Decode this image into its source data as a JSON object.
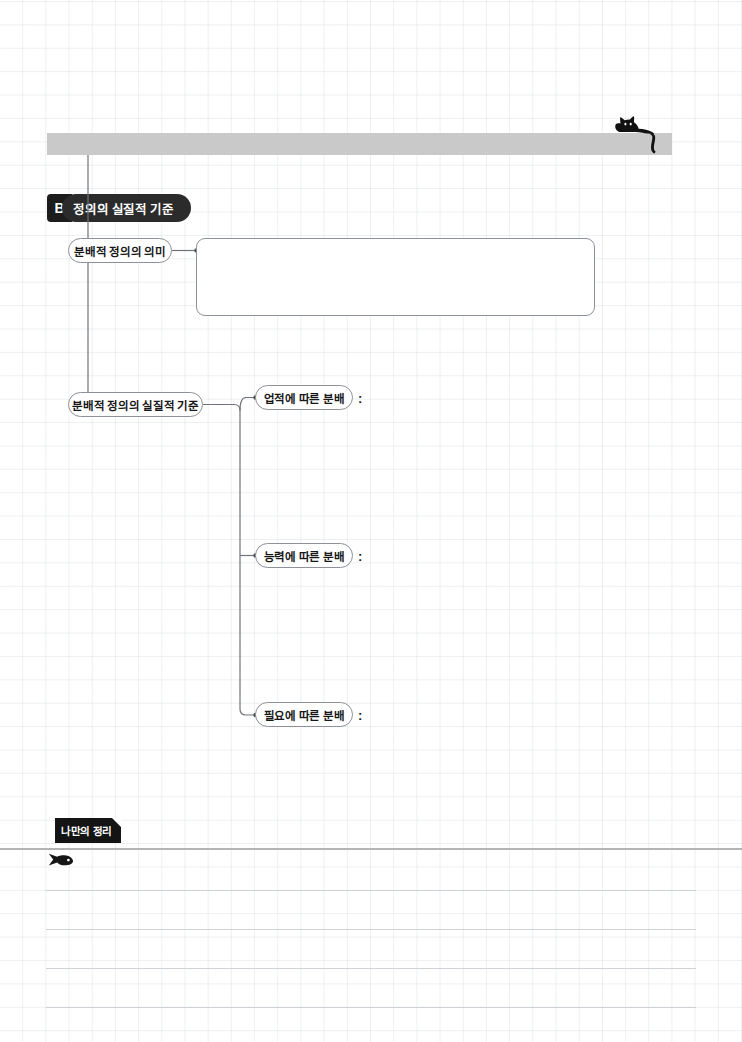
{
  "page": {
    "background": "#ffffff",
    "grid_color": "#e6e9ec",
    "ink_color": "#171717",
    "node_border_color": "#8d9199",
    "band_color": "#c9c9c9",
    "tag_color": "#141414"
  },
  "header": {
    "band_label": "",
    "cat_icon": "black-cat-icon"
  },
  "section": {
    "letter": "B",
    "title": "정의의 실질적 기준"
  },
  "nodes": {
    "meaning": "분배적 정의의 의미",
    "criteria": "분배적 정의의 실질적 기준",
    "merit": "업적에 따른 분배",
    "ability": "능력에 따른 분배",
    "need": "필요에 따른 분배"
  },
  "separators": {
    "colon": ":"
  },
  "answer_box": {
    "value": "",
    "placeholder": ""
  },
  "memo": {
    "tag_label": "나만의 정리",
    "fish_icon": "fish-icon",
    "lines": [
      "",
      "",
      "",
      ""
    ]
  }
}
